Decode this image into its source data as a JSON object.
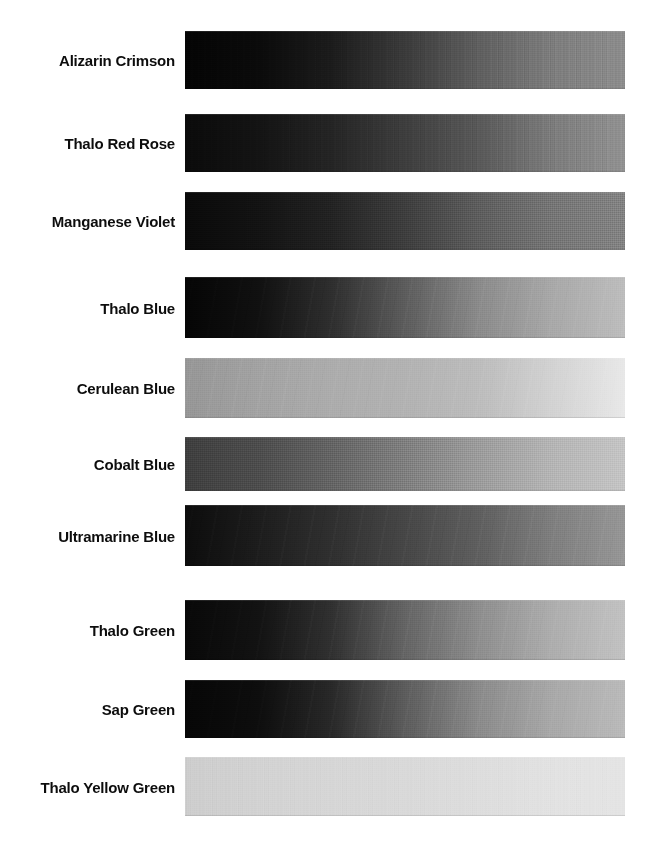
{
  "page": {
    "background_color": "#ffffff",
    "label_color": "#0d0d0d"
  },
  "chart_data": {
    "type": "heatmap",
    "xlabel": "",
    "ylabel": "",
    "categories": [
      "Alizarin Crimson",
      "Thalo Red Rose",
      "Manganese Violet",
      "Thalo Blue",
      "Cerulean Blue",
      "Cobalt Blue",
      "Ultramarine Blue",
      "Thalo Green",
      "Sap Green",
      "Thalo Yellow Green"
    ],
    "legend_position": "none",
    "grid": false,
    "series": [
      {
        "name": "dark_value_left",
        "values": [
          6,
          10,
          9,
          5,
          150,
          62,
          12,
          8,
          6,
          205
        ]
      },
      {
        "name": "mid_value_center",
        "values": [
          34,
          46,
          48,
          96,
          176,
          126,
          70,
          100,
          92,
          214
        ]
      },
      {
        "name": "light_value_right",
        "values": [
          132,
          142,
          128,
          186,
          232,
          196,
          150,
          194,
          186,
          228
        ]
      }
    ]
  },
  "swatches": [
    {
      "label": "Alizarin Crimson",
      "top": 31,
      "height": 58,
      "gradient_stops": [
        "#040404",
        "#0a0a0a",
        "#1b1b1b",
        "#3a3a3a",
        "#5e5e5e",
        "#7c7c7c",
        "#8c8c8c"
      ],
      "texture": "vertical"
    },
    {
      "label": "Thalo Red Rose",
      "top": 114,
      "height": 58,
      "gradient_stops": [
        "#0a0a0a",
        "#131313",
        "#242424",
        "#3d3d3d",
        "#585858",
        "#7b7b7b",
        "#919191"
      ],
      "texture": "vertical"
    },
    {
      "label": "Manganese Violet",
      "top": 192,
      "height": 58,
      "gradient_stops": [
        "#090909",
        "#121212",
        "#222222",
        "#3d3d3d",
        "#5c5c5c",
        "#747474",
        "#828282"
      ],
      "texture": "weave"
    },
    {
      "label": "Thalo Blue",
      "top": 277,
      "height": 61,
      "gradient_stops": [
        "#050505",
        "#101010",
        "#2e2e2e",
        "#5c5c5c",
        "#8a8a8a",
        "#a8a8a8",
        "#bdbdbd"
      ],
      "texture": "diagonal"
    },
    {
      "label": "Cerulean Blue",
      "top": 358,
      "height": 60,
      "gradient_stops": [
        "#969696",
        "#a2a2a2",
        "#acacac",
        "#b2b2b2",
        "#bcbcbc",
        "#d2d2d2",
        "#e8e8e8"
      ],
      "texture": "diagonal"
    },
    {
      "label": "Cobalt Blue",
      "top": 437,
      "height": 54,
      "gradient_stops": [
        "#3e3e3e",
        "#4c4c4c",
        "#636363",
        "#7e7e7e",
        "#9b9b9b",
        "#b4b4b4",
        "#c4c4c4"
      ],
      "texture": "weave"
    },
    {
      "label": "Ultramarine Blue",
      "top": 505,
      "height": 61,
      "gradient_stops": [
        "#0c0c0c",
        "#1c1c1c",
        "#2f2f2f",
        "#464646",
        "#5e5e5e",
        "#7e7e7e",
        "#969696"
      ],
      "texture": "diagonal"
    },
    {
      "label": "Thalo Green",
      "top": 600,
      "height": 60,
      "gradient_stops": [
        "#080808",
        "#121212",
        "#303030",
        "#646464",
        "#8d8d8d",
        "#adadad",
        "#c2c2c2"
      ],
      "texture": "diagonal"
    },
    {
      "label": "Sap Green",
      "top": 680,
      "height": 58,
      "gradient_stops": [
        "#060606",
        "#0d0d0d",
        "#282828",
        "#5c5c5c",
        "#8a8a8a",
        "#a8a8a8",
        "#bababa"
      ],
      "texture": "diagonal"
    },
    {
      "label": "Thalo Yellow Green",
      "top": 757,
      "height": 59,
      "gradient_stops": [
        "#cdcdcd",
        "#d2d2d2",
        "#d6d6d6",
        "#d9d9d9",
        "#dddddd",
        "#e2e2e2",
        "#e4e4e4"
      ],
      "texture": "vertical"
    }
  ]
}
